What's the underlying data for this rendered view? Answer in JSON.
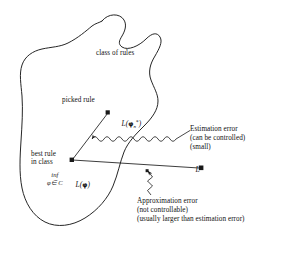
{
  "figure": {
    "background_color": "#ffffff",
    "stroke_color": "#1a1a1a",
    "region_label": "class of rules",
    "labels": {
      "picked_rule": "picked rule",
      "best_rule_line1": "best rule",
      "best_rule_line2": "in class",
      "inf_row1": "inf",
      "inf_row2": "φ∈ C",
      "l_phi_n_star_fn": "L(",
      "l_phi_n_star_phi": "φ",
      "l_phi_n_star_sub": "n",
      "l_phi_n_star_sup": "*",
      "l_phi_n_star_close": ")",
      "l_phi_fn": "L(",
      "l_phi_phi": "φ",
      "l_phi_close": ")",
      "l_star_fn": "L",
      "l_star_sup": "*",
      "estimation_line1": "Estimation error",
      "estimation_line2": "(can be controlled)",
      "estimation_line3": "(small)",
      "approximation_line1": "Approximation error",
      "approximation_line2": "(not controllable)",
      "approximation_line3": "(usually larger than estimation error)"
    },
    "points": {
      "picked_rule_point": {
        "x": 108,
        "y": 112
      },
      "best_rule_point": {
        "x": 72,
        "y": 160
      },
      "l_star_point": {
        "x": 202,
        "y": 167
      }
    },
    "connectors": {
      "estimation_brace": "wavy-double-arrow",
      "approximation_pointer": "zigzag-arrow"
    }
  }
}
